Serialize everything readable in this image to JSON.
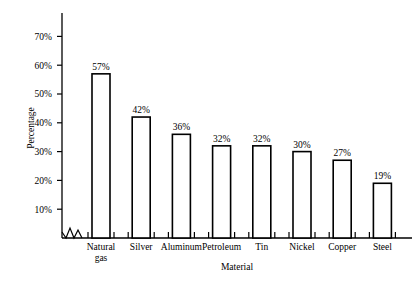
{
  "chart_data": {
    "type": "bar",
    "title": "",
    "xlabel": "Material",
    "ylabel": "Percentage",
    "categories": [
      "Natural gas",
      "Silver",
      "Aluminum",
      "Petroleum",
      "Tin",
      "Nickel",
      "Copper",
      "Steel"
    ],
    "values": [
      57,
      42,
      36,
      32,
      32,
      30,
      27,
      19
    ],
    "value_labels": [
      "57%",
      "42%",
      "36%",
      "32%",
      "32%",
      "30%",
      "27%",
      "19%"
    ],
    "ytick_labels": [
      "10%",
      "20%",
      "30%",
      "40%",
      "50%",
      "60%",
      "70%"
    ],
    "ytick_values": [
      10,
      20,
      30,
      40,
      50,
      60,
      70
    ],
    "ylim": [
      0,
      75
    ],
    "grid": false,
    "legend": null,
    "axis_break": true,
    "bar_style": "outline",
    "bar_fill_color": "#ffffff",
    "bar_edge_color": "#000000",
    "background_color": "#ffffff"
  },
  "axes": {
    "y_title": "Percentage",
    "x_title": "Material"
  },
  "category_label_lines": [
    [
      "Natural",
      "gas"
    ],
    [
      "Silver"
    ],
    [
      "Aluminum"
    ],
    [
      "Petroleum"
    ],
    [
      "Tin"
    ],
    [
      "Nickel"
    ],
    [
      "Copper"
    ],
    [
      "Steel"
    ]
  ]
}
